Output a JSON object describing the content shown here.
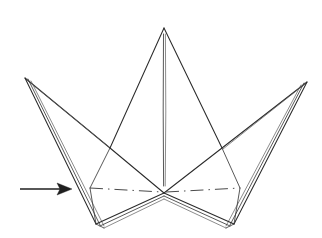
{
  "figure": {
    "background_color": "#ffffff",
    "ink_color": "#2b2b2b",
    "crease_color": "#4a4a4a",
    "arrow_color": "#1f1f1f",
    "canvas": {
      "width": 322,
      "height": 238
    }
  },
  "geometry": {
    "center_peak": {
      "x": 164,
      "y": 28
    },
    "left_wing_tip": {
      "x": 25,
      "y": 78
    },
    "right_wing_tip": {
      "x": 307,
      "y": 82
    },
    "center_base_vertex": {
      "x": 164,
      "y": 193
    },
    "left_junction": {
      "x": 110,
      "y": 148
    },
    "right_junction": {
      "x": 222,
      "y": 148
    },
    "left_base_corner": {
      "x": 98,
      "y": 228
    },
    "right_base_corner": {
      "x": 232,
      "y": 228
    },
    "left_base_shoulder": {
      "x": 90,
      "y": 188
    },
    "right_base_shoulder": {
      "x": 240,
      "y": 188
    }
  },
  "shapes": {
    "center_point_left_edge": "M 164 28 L 110 148 L 164 193",
    "center_point_right_edge": "M 164 28 L 222 148 L 164 193",
    "center_crease_line": "M 163.5 34 L 163.2 110 L 163.6 186",
    "center_crease_line_b": "M 165.4 34 L 165.8 112 L 165.2 186",
    "left_wing_upper_edge": "M 25 78 L 110 148",
    "left_wing_upper_edge_b": "M 27 80 L 109 147",
    "left_wing_outer_edge": "M 25 78 L 96 224",
    "left_wing_outer_edge_b": "M 28 79 L 100 225",
    "left_wing_outer_edge_c": "M 31 81 L 104 226",
    "right_wing_upper_edge": "M 307 82 L 222 148",
    "right_wing_upper_edge_b": "M 305 84 L 223 149",
    "right_wing_outer_edge": "M 307 82 L 234 224",
    "right_wing_outer_edge_b": "M 304 83 L 230 225",
    "right_wing_outer_edge_c": "M 301 85 L 226 226",
    "base_left_v": "M 96 224 L 164 193",
    "base_left_v_b": "M 100 226 L 164 196",
    "base_left_v_c": "M 104 228 L 164 199",
    "base_right_v": "M 234 224 L 164 193",
    "base_right_v_b": "M 230 226 L 164 196",
    "base_right_v_c": "M 226 228 L 164 199",
    "base_left_bottom_cap": "M 96 224 L 104 228",
    "base_right_bottom_cap": "M 234 224 L 226 228",
    "left_base_wall": "M 90 188 L 96 224",
    "right_base_wall": "M 240 188 L 234 224",
    "left_shoulder_to_junction": "M 90 188 L 110 148",
    "right_shoulder_to_junction": "M 240 188 L 222 148",
    "crease_left": "M 90 188 L 162 192",
    "crease_right": "M 166 192 L 240 188",
    "arrow_shaft": "M 20 189 L 60 189",
    "arrow_head": "M 72 189 L 57 183 L 60 189 L 57 195 Z"
  },
  "annotations": {
    "arrow_label": "fold-direction-arrow",
    "crease_label": "mountain-fold-crease-line",
    "left_wing_label": "left-wing-point",
    "right_wing_label": "right-wing-point",
    "center_label": "center-point"
  }
}
